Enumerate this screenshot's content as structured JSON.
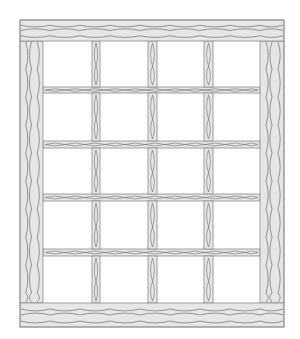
{
  "diagram": {
    "canvas": {
      "width": 300,
      "height": 339,
      "background": "#ffffff"
    },
    "colors": {
      "wood_fill": "#e6e6e6",
      "wood_outline": "#8a8a8a",
      "grain": "#6f6f6f",
      "pane": "#ffffff"
    },
    "frame": {
      "x": 20,
      "y": 20,
      "width": 264,
      "height": 307
    },
    "top_rail": {
      "x": 20,
      "y": 20,
      "width": 264,
      "height": 21
    },
    "bottom_rail": {
      "x": 20,
      "y": 303,
      "width": 264,
      "height": 24
    },
    "left_post": {
      "x": 20,
      "y": 41,
      "width": 23,
      "height": 262
    },
    "right_post": {
      "x": 260,
      "y": 41,
      "width": 24,
      "height": 262
    },
    "vertical_muntins": [
      {
        "x": 92,
        "width": 8
      },
      {
        "x": 148,
        "width": 9
      },
      {
        "x": 204,
        "width": 9
      }
    ],
    "horizontal_muntins": [
      {
        "y": 87,
        "height": 6
      },
      {
        "y": 141,
        "height": 7
      },
      {
        "y": 194,
        "height": 7
      },
      {
        "y": 249,
        "height": 7
      }
    ],
    "grid": {
      "columns": 4,
      "rows": 5,
      "panes": 20
    }
  }
}
